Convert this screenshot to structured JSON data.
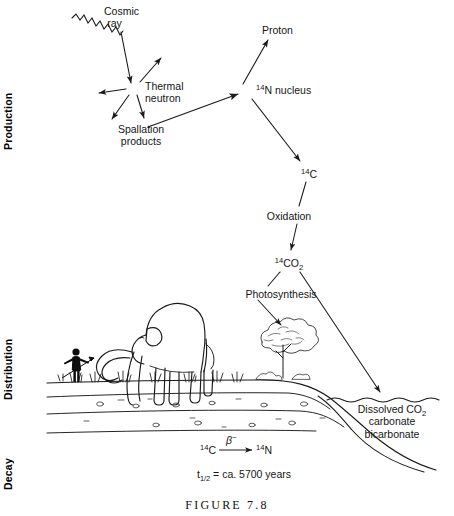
{
  "figure": {
    "caption": "FIGURE 7.8",
    "title_implied": "Radiocarbon cycle: production, distribution and decay of carbon-14"
  },
  "sections": [
    {
      "name": "production",
      "label": "Production",
      "top": 30,
      "height": 120
    },
    {
      "name": "distribution",
      "label": "Distribution",
      "top": 295,
      "height": 105
    },
    {
      "name": "decay",
      "label": "Decay",
      "top": 435,
      "height": 55
    }
  ],
  "nodes": {
    "cosmic_ray": {
      "line1": "Cosmic",
      "line2": "ray",
      "x": 115,
      "y": 6
    },
    "thermal_neutron": {
      "line1": "Thermal",
      "line2": "neutron",
      "x": 148,
      "y": 81
    },
    "spallation": {
      "line1": "Spallation",
      "line2": "products",
      "x": 141,
      "y": 123
    },
    "proton": {
      "text": "Proton",
      "x": 282,
      "y": 27
    },
    "n14_nucleus": {
      "sup": "14",
      "body": "N nucleus",
      "x": 258,
      "y": 84
    },
    "c14": {
      "sup": "14",
      "body": "C",
      "x": 304,
      "y": 170
    },
    "oxidation": {
      "text": "Oxidation",
      "x": 290,
      "y": 213
    },
    "co2_14": {
      "sup": "14",
      "body": "CO",
      "sub": "2",
      "x": 283,
      "y": 260
    },
    "photosynthesis": {
      "text": "Photosynthesis",
      "x": 240,
      "y": 291
    },
    "dissolved": {
      "line1_pre": "Dissolved CO",
      "line1_sub": "2",
      "line2": "carbonate",
      "line3": "bicarbonate",
      "x": 348,
      "y": 404
    }
  },
  "dots": [
    {
      "name": "thermal-neutron-dot",
      "cx": 133,
      "cy": 88,
      "r": 5.2
    },
    {
      "name": "n14-nucleus-dot",
      "cx": 246,
      "cy": 91,
      "r": 5.6
    }
  ],
  "decay_equation": {
    "reactant_sup": "14",
    "reactant": "C",
    "particle": "β",
    "particle_sup": "−",
    "product_sup": "14",
    "product": "N",
    "x": 200,
    "y": 446
  },
  "half_life": {
    "symbol": "t",
    "fraction": "1/2",
    "text": " = ca. 5700 years",
    "x": 197,
    "y": 470
  },
  "colors": {
    "background": "#ffffff",
    "ink": "#151515",
    "stroke": "#1a1a1a",
    "silhouette": "#0d0d0d"
  }
}
